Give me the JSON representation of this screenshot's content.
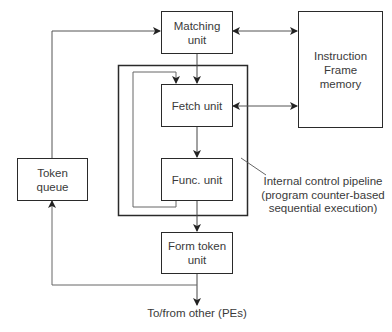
{
  "diagram": {
    "type": "block-diagram",
    "nodes": {
      "matching": {
        "label": "Matching\nunit"
      },
      "instruction": {
        "label": "Instruction\nFrame\nmemory"
      },
      "fetch": {
        "label": "Fetch unit"
      },
      "func": {
        "label": "Func. unit"
      },
      "token_queue": {
        "label": "Token\nqueue"
      },
      "form_token": {
        "label": "Form token\nunit"
      }
    },
    "group": {
      "label": "Internal control pipeline\n(program counter-based\nsequential execution)"
    },
    "external": {
      "label": "To/from other (PEs)"
    },
    "edges": [
      {
        "from": "token_queue",
        "to": "matching"
      },
      {
        "from": "matching",
        "to": "instruction",
        "bidirectional": true
      },
      {
        "from": "matching",
        "to": "fetch"
      },
      {
        "from": "fetch",
        "to": "instruction",
        "bidirectional": true
      },
      {
        "from": "fetch",
        "to": "func"
      },
      {
        "from": "func",
        "to": "fetch",
        "note": "feedback loop"
      },
      {
        "from": "func",
        "to": "form_token"
      },
      {
        "from": "form_token",
        "to": "token_queue"
      },
      {
        "from": "form_token",
        "to": "external"
      }
    ]
  }
}
